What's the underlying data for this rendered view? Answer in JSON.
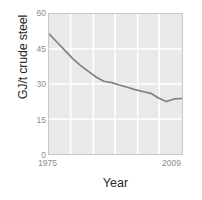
{
  "chart_data": {
    "type": "line",
    "title": "",
    "xlabel": "Year",
    "ylabel": "GJ/t crude steel",
    "xlim": [
      1975,
      2009
    ],
    "ylim": [
      0,
      60
    ],
    "yticks": [
      60,
      45,
      30,
      15,
      0
    ],
    "ytick_labels": [
      "60",
      "45",
      "30",
      "15",
      "0"
    ],
    "xticks": [
      1975,
      2009
    ],
    "xtick_labels": [
      "1975",
      "2009"
    ],
    "grid": true,
    "grid_color": "#ffffff",
    "plot_background": "#e9e9e9",
    "line_color": "#808080",
    "legend": null,
    "series": [
      {
        "name": "Energy intensity",
        "x": [
          1975,
          1977,
          1979,
          1981,
          1983,
          1985,
          1987,
          1989,
          1991,
          1993,
          1995,
          1997,
          1999,
          2001,
          2003,
          2005,
          2007,
          2009
        ],
        "values": [
          51.5,
          48.0,
          44.5,
          41.0,
          38.0,
          35.5,
          33.0,
          31.2,
          30.6,
          29.6,
          28.6,
          27.6,
          26.8,
          26.0,
          24.0,
          22.5,
          23.6,
          23.8
        ]
      }
    ]
  },
  "axis": {
    "y_title": "GJ/t crude steel",
    "x_title": "Year"
  }
}
